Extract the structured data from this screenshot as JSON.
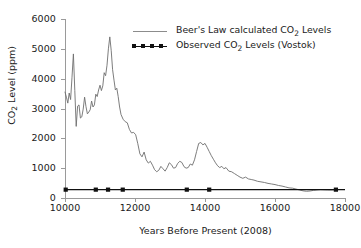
{
  "chart_data": {
    "type": "line",
    "title": "",
    "xlabel": "Years Before Present (2008)",
    "ylabel": "CO 2 Level (ppm)",
    "ylabel_parts": {
      "pre": "CO",
      "sub": "2",
      "post": " Level (ppm)"
    },
    "xlim": [
      10000,
      18000
    ],
    "ylim": [
      0,
      6000
    ],
    "xticks": [
      10000,
      12000,
      14000,
      16000,
      18000
    ],
    "yticks": [
      0,
      1000,
      2000,
      3000,
      4000,
      5000,
      6000
    ],
    "xtick_labels": [
      "10000",
      "12000",
      "14000",
      "16000",
      "18000"
    ],
    "ytick_labels": [
      "0",
      "1000",
      "2000",
      "3000",
      "4000",
      "5000",
      "6000"
    ],
    "grid": false,
    "legend_position": "top-center",
    "legend": [
      {
        "label_pre": "Beer's Law calculated CO",
        "label_sub": "2",
        "label_post": " Levels",
        "style": "line",
        "color": "#8c8c8c"
      },
      {
        "label_pre": "Observed CO",
        "label_sub": "2",
        "label_post": " Levels (Vostok)",
        "style": "line-markers",
        "color": "#111111"
      }
    ],
    "series": [
      {
        "name": "Beer's Law calculated CO2 Levels",
        "color": "#6e6e6e",
        "x": [
          10000,
          10040,
          10080,
          10120,
          10160,
          10200,
          10240,
          10280,
          10320,
          10360,
          10400,
          10440,
          10480,
          10520,
          10560,
          10600,
          10640,
          10680,
          10720,
          10760,
          10800,
          10840,
          10880,
          10920,
          10960,
          11000,
          11040,
          11080,
          11120,
          11160,
          11200,
          11240,
          11280,
          11320,
          11360,
          11400,
          11440,
          11480,
          11520,
          11560,
          11600,
          11660,
          11720,
          11780,
          11840,
          11900,
          11960,
          12020,
          12080,
          12140,
          12200,
          12260,
          12320,
          12380,
          12440,
          12500,
          12560,
          12620,
          12680,
          12740,
          12800,
          12860,
          12920,
          12980,
          13040,
          13100,
          13160,
          13220,
          13280,
          13340,
          13400,
          13460,
          13520,
          13580,
          13640,
          13700,
          13760,
          13820,
          13880,
          13940,
          14000,
          14060,
          14120,
          14180,
          14240,
          14300,
          14360,
          14420,
          14480,
          14540,
          14600,
          14680,
          14760,
          14840,
          14920,
          15000,
          15080,
          15160,
          15240,
          15320,
          15400,
          15500,
          15600,
          15700,
          15800,
          15900,
          16000,
          16100,
          16200,
          16300,
          16400,
          16500,
          16600,
          16700,
          16800,
          16900,
          17000,
          17100,
          17200,
          17300,
          17400,
          17500,
          17600,
          17700,
          17800
        ],
        "y": [
          3550,
          3380,
          3180,
          3520,
          3300,
          4050,
          4830,
          3600,
          2400,
          3080,
          3120,
          2680,
          2720,
          2980,
          3380,
          3060,
          2820,
          2880,
          2960,
          3250,
          3050,
          3120,
          3480,
          3400,
          3620,
          3780,
          3600,
          3760,
          4200,
          4100,
          4450,
          5000,
          5400,
          4950,
          4300,
          3950,
          3620,
          3680,
          3400,
          3050,
          2800,
          2640,
          2560,
          2520,
          2300,
          2180,
          2200,
          2120,
          1820,
          1480,
          1380,
          1540,
          1280,
          1170,
          1230,
          1100,
          950,
          880,
          930,
          1060,
          980,
          900,
          1020,
          1180,
          1120,
          1000,
          1020,
          1160,
          1230,
          1190,
          1050,
          1000,
          1020,
          1140,
          1100,
          1280,
          1560,
          1830,
          1860,
          1780,
          1830,
          1700,
          1560,
          1420,
          1300,
          1180,
          1080,
          1020,
          1060,
          980,
          1020,
          900,
          880,
          820,
          760,
          700,
          660,
          700,
          640,
          620,
          600,
          560,
          540,
          520,
          490,
          470,
          450,
          420,
          400,
          370,
          340,
          330,
          300,
          270,
          240,
          225,
          235,
          255,
          270,
          280,
          275,
          270,
          268,
          272,
          278
        ]
      },
      {
        "name": "Observed CO2 Levels (Vostok)",
        "color": "#111111",
        "x": [
          10020,
          10880,
          11230,
          11650,
          13480,
          14120,
          17740
        ],
        "y": [
          280,
          280,
          280,
          280,
          280,
          280,
          280
        ],
        "marker": "square"
      }
    ]
  }
}
